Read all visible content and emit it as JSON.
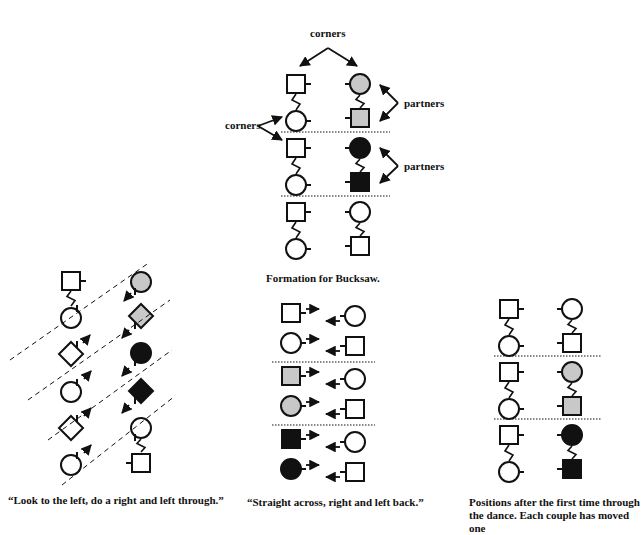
{
  "colors": {
    "ink": "#111111",
    "gray_fill": "#c8c8c8",
    "black_fill": "#111111",
    "white_fill": "#ffffff"
  },
  "top_figure": {
    "labels": {
      "corners_top": "corners",
      "corners_left": "corners",
      "partners_1": "partners",
      "partners_2": "partners"
    },
    "caption": "Formation for Bucksaw.",
    "couples": [
      {
        "left": [
          {
            "shape": "square",
            "fill": "white"
          },
          {
            "shape": "circle",
            "fill": "white"
          }
        ],
        "right": [
          {
            "shape": "circle",
            "fill": "gray"
          },
          {
            "shape": "square",
            "fill": "gray"
          }
        ]
      },
      {
        "left": [
          {
            "shape": "square",
            "fill": "white"
          },
          {
            "shape": "circle",
            "fill": "white"
          }
        ],
        "right": [
          {
            "shape": "circle",
            "fill": "black"
          },
          {
            "shape": "square",
            "fill": "black"
          }
        ]
      },
      {
        "left": [
          {
            "shape": "square",
            "fill": "white"
          },
          {
            "shape": "circle",
            "fill": "white"
          }
        ],
        "right": [
          {
            "shape": "circle",
            "fill": "white"
          },
          {
            "shape": "square",
            "fill": "white"
          }
        ]
      }
    ]
  },
  "left_figure": {
    "caption": "“Look to the left, do a right and left through.”",
    "left_column": [
      {
        "shape": "square",
        "fill": "white"
      },
      {
        "shape": "circle",
        "fill": "white"
      },
      {
        "shape": "diamond",
        "fill": "white"
      },
      {
        "shape": "circle",
        "fill": "white"
      },
      {
        "shape": "diamond",
        "fill": "white"
      },
      {
        "shape": "circle",
        "fill": "white"
      }
    ],
    "right_column": [
      {
        "shape": "circle",
        "fill": "gray"
      },
      {
        "shape": "diamond",
        "fill": "gray"
      },
      {
        "shape": "circle",
        "fill": "black"
      },
      {
        "shape": "diamond",
        "fill": "black"
      },
      {
        "shape": "circle",
        "fill": "white"
      },
      {
        "shape": "square",
        "fill": "white"
      }
    ]
  },
  "middle_figure": {
    "caption": "“Straight across, right and left back.”",
    "rows": [
      {
        "left": {
          "shape": "square",
          "fill": "white"
        },
        "right": {
          "shape": "circle",
          "fill": "white"
        }
      },
      {
        "left": {
          "shape": "circle",
          "fill": "white"
        },
        "right": {
          "shape": "square",
          "fill": "white"
        }
      },
      {
        "left": {
          "shape": "square",
          "fill": "gray"
        },
        "right": {
          "shape": "circle",
          "fill": "white"
        }
      },
      {
        "left": {
          "shape": "circle",
          "fill": "gray"
        },
        "right": {
          "shape": "square",
          "fill": "white"
        }
      },
      {
        "left": {
          "shape": "square",
          "fill": "black"
        },
        "right": {
          "shape": "circle",
          "fill": "white"
        }
      },
      {
        "left": {
          "shape": "circle",
          "fill": "black"
        },
        "right": {
          "shape": "square",
          "fill": "white"
        }
      }
    ]
  },
  "right_figure": {
    "caption": "Positions after the first time through the dance. Each couple has moved one",
    "couples": [
      {
        "left": [
          {
            "shape": "square",
            "fill": "white"
          },
          {
            "shape": "circle",
            "fill": "white"
          }
        ],
        "right": [
          {
            "shape": "circle",
            "fill": "white"
          },
          {
            "shape": "square",
            "fill": "white"
          }
        ]
      },
      {
        "left": [
          {
            "shape": "square",
            "fill": "white"
          },
          {
            "shape": "circle",
            "fill": "white"
          }
        ],
        "right": [
          {
            "shape": "circle",
            "fill": "gray"
          },
          {
            "shape": "square",
            "fill": "gray"
          }
        ]
      },
      {
        "left": [
          {
            "shape": "square",
            "fill": "white"
          },
          {
            "shape": "circle",
            "fill": "white"
          }
        ],
        "right": [
          {
            "shape": "circle",
            "fill": "black"
          },
          {
            "shape": "square",
            "fill": "black"
          }
        ]
      }
    ]
  }
}
